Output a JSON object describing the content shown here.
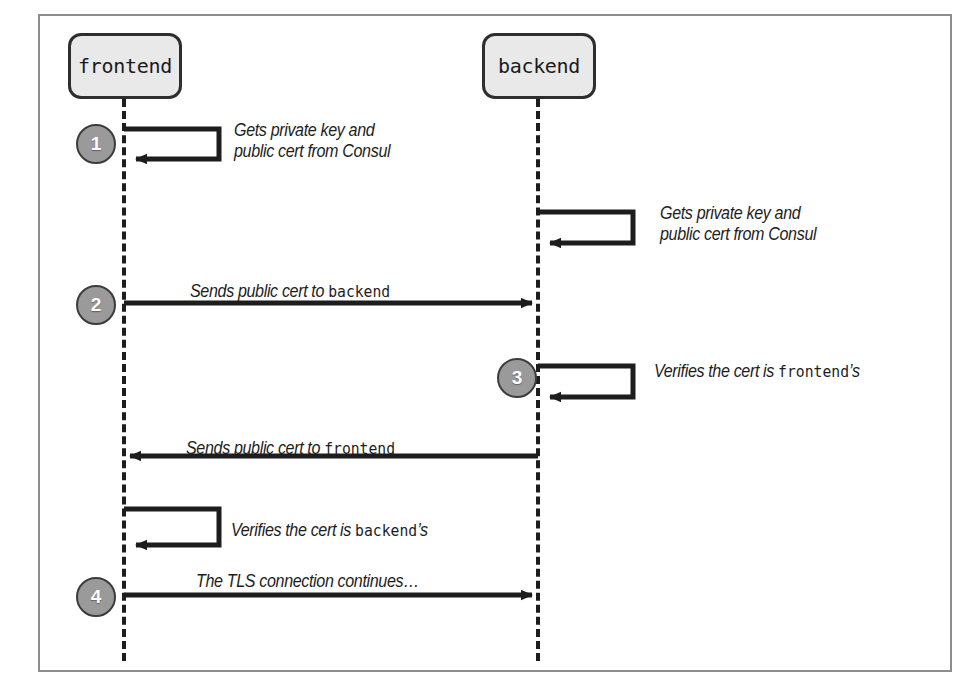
{
  "figure": {
    "type": "uml-sequence-diagram",
    "participants": [
      {
        "id": "frontend",
        "label": "frontend"
      },
      {
        "id": "backend",
        "label": "backend"
      }
    ],
    "steps": [
      {
        "number": "1",
        "kind": "self-call",
        "actor": "frontend",
        "label_lines": [
          "Gets private key and",
          "public cert from Consul"
        ],
        "label_plain": "Gets private key and public cert from Consul"
      },
      {
        "number": "",
        "kind": "self-call",
        "actor": "backend",
        "label_lines": [
          "Gets private key and",
          "public cert from Consul"
        ],
        "label_plain": "Gets private key and public cert from Consul"
      },
      {
        "number": "2",
        "kind": "message",
        "from": "frontend",
        "to": "backend",
        "direction": "right",
        "label_prefix": "Sends public cert to ",
        "label_code": "backend",
        "label_suffix": "",
        "label_plain": "Sends public cert to backend"
      },
      {
        "number": "3",
        "kind": "self-call",
        "actor": "backend",
        "label_prefix": "Verifies the cert is ",
        "label_code": "frontend",
        "label_suffix": "’s",
        "label_plain": "Verifies the cert is frontend’s"
      },
      {
        "number": "",
        "kind": "message",
        "from": "backend",
        "to": "frontend",
        "direction": "left",
        "label_prefix": "Sends public cert to ",
        "label_code": "frontend",
        "label_suffix": "",
        "label_plain": "Sends public cert to frontend"
      },
      {
        "number": "",
        "kind": "self-call",
        "actor": "frontend",
        "label_prefix": "Verifies the cert is ",
        "label_code": "backend",
        "label_suffix": "’s",
        "label_plain": "Verifies the cert is backend’s"
      },
      {
        "number": "4",
        "kind": "message",
        "from": "frontend",
        "to": "backend",
        "direction": "right",
        "label_prefix": "The TLS connection continues…",
        "label_code": "",
        "label_suffix": "",
        "label_plain": "The TLS connection continues…"
      }
    ],
    "badges": [
      "1",
      "2",
      "3",
      "4"
    ],
    "colors": {
      "frame_border": "#8d8d8d",
      "actor_fill": "#e9e9e9",
      "actor_border": "#2e2e2e",
      "lifeline": "#1d1d1d",
      "badge_fill": "#9a9a9a",
      "badge_border": "#3c3c3c",
      "badge_text": "#ffffff",
      "arrow": "#1d1d1d",
      "label_text": "#1d1d1d"
    },
    "caption": ""
  }
}
